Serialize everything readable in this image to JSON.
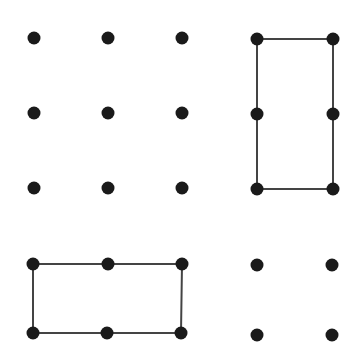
{
  "canvas": {
    "width": 359,
    "height": 359,
    "background": "#ffffff"
  },
  "style": {
    "dot_color": "#1a1a1a",
    "dot_radius": 6.5,
    "line_color": "#444444",
    "line_width": 2
  },
  "figures": [
    {
      "name": "top-left-dot-grid",
      "dots": [
        [
          34,
          38
        ],
        [
          108,
          38
        ],
        [
          182,
          38
        ],
        [
          34,
          113
        ],
        [
          108,
          113
        ],
        [
          182,
          113
        ],
        [
          34,
          188
        ],
        [
          108,
          188
        ],
        [
          182,
          188
        ]
      ],
      "outline": []
    },
    {
      "name": "top-right-vertical-rectangle",
      "dots": [
        [
          257,
          39
        ],
        [
          333,
          39
        ],
        [
          257,
          114
        ],
        [
          333,
          114
        ],
        [
          257,
          189
        ],
        [
          333,
          189
        ]
      ],
      "outline": [
        [
          257,
          39
        ],
        [
          333,
          39
        ],
        [
          333,
          189
        ],
        [
          257,
          189
        ]
      ]
    },
    {
      "name": "bottom-left-horizontal-rectangle",
      "dots": [
        [
          33,
          264
        ],
        [
          108,
          264
        ],
        [
          182,
          264
        ],
        [
          33,
          333
        ],
        [
          107,
          333
        ],
        [
          181,
          333
        ]
      ],
      "outline": [
        [
          33,
          264
        ],
        [
          182,
          264
        ],
        [
          181,
          333
        ],
        [
          33,
          333
        ]
      ]
    },
    {
      "name": "bottom-right-dot-grid",
      "dots": [
        [
          257,
          265
        ],
        [
          332,
          265
        ],
        [
          257,
          335
        ],
        [
          332,
          335
        ]
      ],
      "outline": []
    }
  ]
}
